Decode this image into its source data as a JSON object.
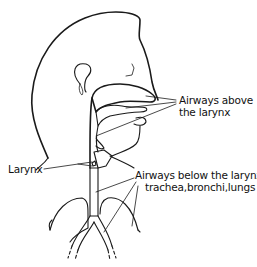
{
  "figure": {
    "labels": {
      "above_line1": "Airways above",
      "above_line2": "the larynx",
      "larynx": "Larynx",
      "below_line1": "Airways below the larynx:",
      "below_line2": "trachea,bronchi,lungs"
    },
    "colors": {
      "ink": "#1a1a1a",
      "background": "#ffffff",
      "stipple": "#888888"
    }
  }
}
